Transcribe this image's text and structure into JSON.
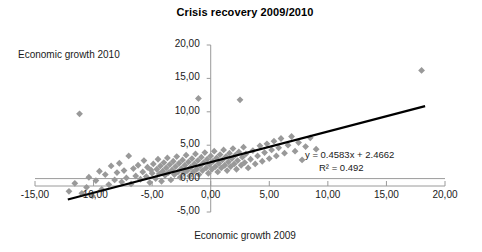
{
  "chart_data": {
    "type": "scatter",
    "title": "Crisis recovery 2009/2010",
    "xlabel": "Economic growth 2009",
    "ylabel": "Economic growth 2010",
    "xlim": [
      -15,
      20
    ],
    "ylim": [
      -5,
      20
    ],
    "xticks": [
      -15,
      -10,
      -5,
      0,
      5,
      10,
      15,
      20
    ],
    "yticks": [
      -5,
      0,
      5,
      10,
      15,
      20
    ],
    "xtick_labels": [
      "-15,00",
      "-10,00",
      "-5,00",
      "0,00",
      "5,00",
      "10,00",
      "15,00",
      "20,00"
    ],
    "ytick_labels": [
      "-5,00",
      "0,00",
      "5,00",
      "10,00",
      "15,00",
      "20,00"
    ],
    "grid": false,
    "legend": false,
    "marker": {
      "shape": "diamond",
      "color": "#999999",
      "size": 3.4
    },
    "trendline": {
      "slope": 0.4583,
      "intercept": 2.4662,
      "r_squared": 0.492,
      "equation_text": "y = 0.4583x + 2.4662",
      "r2_text": "R² = 0.492",
      "color": "#000000",
      "x_start": -12.2,
      "x_end": 18.3
    },
    "points": [
      [
        -12.1,
        -1.9
      ],
      [
        -11.6,
        -0.7
      ],
      [
        -11.2,
        9.7
      ],
      [
        -11.0,
        -2.2
      ],
      [
        -10.6,
        -1.3
      ],
      [
        -10.4,
        0.2
      ],
      [
        -10.1,
        -2.6
      ],
      [
        -9.8,
        -0.3
      ],
      [
        -9.5,
        1.1
      ],
      [
        -9.3,
        -1.6
      ],
      [
        -9.0,
        0.6
      ],
      [
        -8.7,
        -0.9
      ],
      [
        -8.5,
        1.9
      ],
      [
        -8.2,
        -0.2
      ],
      [
        -8.0,
        0.9
      ],
      [
        -7.8,
        2.3
      ],
      [
        -7.6,
        -0.5
      ],
      [
        -7.4,
        1.2
      ],
      [
        -7.2,
        0.1
      ],
      [
        -7.0,
        3.4
      ],
      [
        -6.8,
        -0.8
      ],
      [
        -6.6,
        1.5
      ],
      [
        -6.4,
        0.4
      ],
      [
        -6.2,
        2.0
      ],
      [
        -6.0,
        -0.1
      ],
      [
        -5.8,
        1.0
      ],
      [
        -5.7,
        2.7
      ],
      [
        -5.5,
        0.3
      ],
      [
        -5.4,
        1.7
      ],
      [
        -5.2,
        -0.6
      ],
      [
        -5.1,
        1.3
      ],
      [
        -5.0,
        0.8
      ],
      [
        -4.9,
        2.2
      ],
      [
        -4.7,
        0.0
      ],
      [
        -4.6,
        1.4
      ],
      [
        -4.5,
        2.9
      ],
      [
        -4.4,
        0.7
      ],
      [
        -4.3,
        1.9
      ],
      [
        -4.2,
        -0.4
      ],
      [
        -4.1,
        1.1
      ],
      [
        -4.0,
        2.4
      ],
      [
        -3.9,
        0.5
      ],
      [
        -3.8,
        1.6
      ],
      [
        -3.7,
        3.1
      ],
      [
        -3.6,
        0.9
      ],
      [
        -3.5,
        2.1
      ],
      [
        -3.4,
        -0.2
      ],
      [
        -3.3,
        1.3
      ],
      [
        -3.2,
        2.6
      ],
      [
        -3.1,
        0.6
      ],
      [
        -3.0,
        1.8
      ],
      [
        -2.9,
        3.3
      ],
      [
        -2.8,
        1.0
      ],
      [
        -2.7,
        2.3
      ],
      [
        -2.6,
        0.2
      ],
      [
        -2.5,
        1.5
      ],
      [
        -2.4,
        2.8
      ],
      [
        -2.3,
        0.8
      ],
      [
        -2.2,
        2.0
      ],
      [
        -2.1,
        3.5
      ],
      [
        -2.0,
        1.2
      ],
      [
        -1.9,
        2.5
      ],
      [
        -1.8,
        0.4
      ],
      [
        -1.7,
        1.7
      ],
      [
        -1.6,
        3.0
      ],
      [
        -1.5,
        1.0
      ],
      [
        -1.4,
        2.2
      ],
      [
        -1.3,
        3.7
      ],
      [
        -1.2,
        1.4
      ],
      [
        -1.1,
        2.7
      ],
      [
        -1.05,
        12.0
      ],
      [
        -1.0,
        0.6
      ],
      [
        -0.9,
        1.9
      ],
      [
        -0.8,
        3.2
      ],
      [
        -0.7,
        1.2
      ],
      [
        -0.6,
        2.4
      ],
      [
        -0.5,
        3.9
      ],
      [
        -0.4,
        1.6
      ],
      [
        -0.3,
        2.9
      ],
      [
        -0.2,
        0.8
      ],
      [
        -0.1,
        2.1
      ],
      [
        0.0,
        3.4
      ],
      [
        0.1,
        1.4
      ],
      [
        0.2,
        2.6
      ],
      [
        0.3,
        4.1
      ],
      [
        0.4,
        1.8
      ],
      [
        0.5,
        3.1
      ],
      [
        0.6,
        1.0
      ],
      [
        0.7,
        2.3
      ],
      [
        0.8,
        3.6
      ],
      [
        0.9,
        1.6
      ],
      [
        1.0,
        2.8
      ],
      [
        1.1,
        4.3
      ],
      [
        1.2,
        2.0
      ],
      [
        1.3,
        3.3
      ],
      [
        1.4,
        1.2
      ],
      [
        1.5,
        2.5
      ],
      [
        1.6,
        3.8
      ],
      [
        1.7,
        1.8
      ],
      [
        1.8,
        3.0
      ],
      [
        1.9,
        4.5
      ],
      [
        2.0,
        2.2
      ],
      [
        2.1,
        3.5
      ],
      [
        2.2,
        1.4
      ],
      [
        2.3,
        2.7
      ],
      [
        2.4,
        4.0
      ],
      [
        2.5,
        11.8
      ],
      [
        2.6,
        2.0
      ],
      [
        2.7,
        3.2
      ],
      [
        2.8,
        4.7
      ],
      [
        2.9,
        2.4
      ],
      [
        3.0,
        3.7
      ],
      [
        3.2,
        1.6
      ],
      [
        3.4,
        2.9
      ],
      [
        3.6,
        4.2
      ],
      [
        3.8,
        2.2
      ],
      [
        4.0,
        3.4
      ],
      [
        4.2,
        4.9
      ],
      [
        4.4,
        2.6
      ],
      [
        4.6,
        3.9
      ],
      [
        4.8,
        5.2
      ],
      [
        5.0,
        3.0
      ],
      [
        5.2,
        4.3
      ],
      [
        5.4,
        5.6
      ],
      [
        5.6,
        3.4
      ],
      [
        5.8,
        4.6
      ],
      [
        6.0,
        6.0
      ],
      [
        6.3,
        3.8
      ],
      [
        6.6,
        5.0
      ],
      [
        6.9,
        6.3
      ],
      [
        7.2,
        4.1
      ],
      [
        7.5,
        5.4
      ],
      [
        7.8,
        2.8
      ],
      [
        8.1,
        4.8
      ],
      [
        8.5,
        6.1
      ],
      [
        9.0,
        4.4
      ],
      [
        18.0,
        16.2
      ]
    ]
  },
  "annotations": {
    "title": "Crisis recovery 2009/2010",
    "y_axis_caption": "Economic growth 2010",
    "x_axis_caption": "Economic growth 2009"
  }
}
